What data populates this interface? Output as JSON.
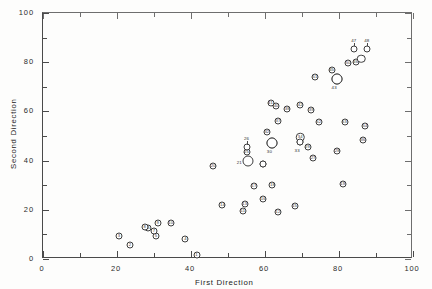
{
  "chart_data": {
    "type": "scatter",
    "title": "",
    "xlabel": "First Direction",
    "ylabel": "Second Direction",
    "xlim": [
      0,
      100
    ],
    "ylim": [
      0,
      100
    ],
    "xticks": [
      0,
      20,
      40,
      60,
      80,
      100
    ],
    "yticks": [
      0,
      20,
      40,
      60,
      80,
      100
    ],
    "xticklabels": [
      "0",
      "20",
      "40",
      "60",
      "80",
      "100"
    ],
    "yticklabels": [
      "0",
      "20",
      "40",
      "60",
      "80",
      "100"
    ],
    "minor_tick_step": 10,
    "grid": false,
    "legend": null,
    "marker": "open-circle-with-id",
    "point_count": 54,
    "points": [
      {
        "id": "1",
        "x": 41.5,
        "y": 1.5,
        "size": "s",
        "label_pos": "inside"
      },
      {
        "id": "2",
        "x": 23.5,
        "y": 5.5,
        "size": "s",
        "label_pos": "inside"
      },
      {
        "id": "3",
        "x": 20.5,
        "y": 9.5,
        "size": "s",
        "label_pos": "inside"
      },
      {
        "id": "4",
        "x": 38.5,
        "y": 8.0,
        "size": "s",
        "label_pos": "inside"
      },
      {
        "id": "5",
        "x": 30.5,
        "y": 9.5,
        "size": "s",
        "label_pos": "inside"
      },
      {
        "id": "6",
        "x": 28.5,
        "y": 12.5,
        "size": "s",
        "label_pos": "inside"
      },
      {
        "id": "7",
        "x": 30.0,
        "y": 11.5,
        "size": "s",
        "label_pos": "inside"
      },
      {
        "id": "8",
        "x": 27.5,
        "y": 13.0,
        "size": "s",
        "label_pos": "inside"
      },
      {
        "id": "9",
        "x": 31.0,
        "y": 14.5,
        "size": "s",
        "label_pos": "inside"
      },
      {
        "id": "10",
        "x": 34.5,
        "y": 14.5,
        "size": "s",
        "label_pos": "inside"
      },
      {
        "id": "11",
        "x": 54.0,
        "y": 19.5,
        "size": "s",
        "label_pos": "inside"
      },
      {
        "id": "12",
        "x": 63.5,
        "y": 19.0,
        "size": "s",
        "label_pos": "inside"
      },
      {
        "id": "13",
        "x": 54.5,
        "y": 22.5,
        "size": "s",
        "label_pos": "inside"
      },
      {
        "id": "14",
        "x": 48.5,
        "y": 22.0,
        "size": "s",
        "label_pos": "inside"
      },
      {
        "id": "15",
        "x": 68.0,
        "y": 21.5,
        "size": "s",
        "label_pos": "inside"
      },
      {
        "id": "16",
        "x": 59.5,
        "y": 24.5,
        "size": "s",
        "label_pos": "inside"
      },
      {
        "id": "17",
        "x": 57.0,
        "y": 29.5,
        "size": "s",
        "label_pos": "inside"
      },
      {
        "id": "18",
        "x": 62.0,
        "y": 30.0,
        "size": "s",
        "label_pos": "inside"
      },
      {
        "id": "19",
        "x": 81.0,
        "y": 30.5,
        "size": "s",
        "label_pos": "inside"
      },
      {
        "id": "20",
        "x": 46.0,
        "y": 38.0,
        "size": "s",
        "label_pos": "inside"
      },
      {
        "id": "21",
        "x": 55.5,
        "y": 40.0,
        "size": "s",
        "label_pos": "left"
      },
      {
        "id": "22",
        "x": 55.5,
        "y": 40.0,
        "size": "l",
        "label_pos": "none"
      },
      {
        "id": "23",
        "x": 59.5,
        "y": 38.5,
        "size": "s",
        "label_pos": "inside"
      },
      {
        "id": "24",
        "x": 59.5,
        "y": 38.5,
        "size": "s",
        "label_pos": "none"
      },
      {
        "id": "25",
        "x": 55.0,
        "y": 43.5,
        "size": "s",
        "label_pos": "inside"
      },
      {
        "id": "26",
        "x": 55.0,
        "y": 45.5,
        "size": "s",
        "label_pos": "above"
      },
      {
        "id": "27",
        "x": 73.0,
        "y": 41.0,
        "size": "s",
        "label_pos": "inside"
      },
      {
        "id": "28",
        "x": 79.5,
        "y": 44.0,
        "size": "s",
        "label_pos": "inside"
      },
      {
        "id": "29",
        "x": 71.5,
        "y": 45.5,
        "size": "s",
        "label_pos": "inside"
      },
      {
        "id": "30",
        "x": 62.0,
        "y": 47.0,
        "size": "l",
        "label_pos": "below"
      },
      {
        "id": "31",
        "x": 62.0,
        "y": 47.0,
        "size": "l",
        "label_pos": "none"
      },
      {
        "id": "32",
        "x": 60.5,
        "y": 51.5,
        "size": "s",
        "label_pos": "inside"
      },
      {
        "id": "33",
        "x": 69.5,
        "y": 47.5,
        "size": "s",
        "label_pos": "below"
      },
      {
        "id": "34",
        "x": 69.5,
        "y": 49.5,
        "size": "m",
        "label_pos": "inside"
      },
      {
        "id": "35",
        "x": 69.5,
        "y": 47.5,
        "size": "s",
        "label_pos": "none"
      },
      {
        "id": "36",
        "x": 86.5,
        "y": 48.5,
        "size": "s",
        "label_pos": "inside"
      },
      {
        "id": "37",
        "x": 63.5,
        "y": 56.0,
        "size": "s",
        "label_pos": "inside"
      },
      {
        "id": "38",
        "x": 66.0,
        "y": 61.0,
        "size": "s",
        "label_pos": "inside"
      },
      {
        "id": "39",
        "x": 72.5,
        "y": 60.5,
        "size": "s",
        "label_pos": "inside"
      },
      {
        "id": "40",
        "x": 63.0,
        "y": 62.0,
        "size": "s",
        "label_pos": "inside"
      },
      {
        "id": "41",
        "x": 61.5,
        "y": 63.5,
        "size": "s",
        "label_pos": "inside"
      },
      {
        "id": "42",
        "x": 69.5,
        "y": 62.5,
        "size": "s",
        "label_pos": "inside"
      },
      {
        "id": "43",
        "x": 79.5,
        "y": 73.0,
        "size": "l",
        "label_pos": "below"
      },
      {
        "id": "44",
        "x": 79.5,
        "y": 73.0,
        "size": "l",
        "label_pos": "none"
      },
      {
        "id": "45",
        "x": 78.0,
        "y": 77.0,
        "size": "s",
        "label_pos": "inside"
      },
      {
        "id": "46",
        "x": 84.5,
        "y": 80.0,
        "size": "s",
        "label_pos": "inside"
      },
      {
        "id": "47",
        "x": 84.0,
        "y": 85.5,
        "size": "s",
        "label_pos": "above"
      },
      {
        "id": "48",
        "x": 87.5,
        "y": 85.5,
        "size": "s",
        "label_pos": "above"
      },
      {
        "id": "49",
        "x": 86.0,
        "y": 81.5,
        "size": "m",
        "label_pos": "none"
      },
      {
        "id": "50",
        "x": 82.5,
        "y": 79.5,
        "size": "s",
        "label_pos": "inside"
      },
      {
        "id": "51",
        "x": 73.5,
        "y": 74.0,
        "size": "s",
        "label_pos": "inside"
      },
      {
        "id": "52",
        "x": 74.5,
        "y": 55.5,
        "size": "s",
        "label_pos": "inside"
      },
      {
        "id": "53",
        "x": 81.5,
        "y": 55.5,
        "size": "s",
        "label_pos": "inside"
      },
      {
        "id": "54",
        "x": 87.0,
        "y": 54.0,
        "size": "s",
        "label_pos": "inside"
      }
    ]
  }
}
